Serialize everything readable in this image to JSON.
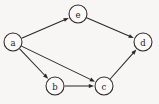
{
  "figure": {
    "kind": "directed-graph",
    "background_color": "#f7f6f4",
    "stroke_color": "#2a2724",
    "node_fill_color": "#fbfaf8",
    "node_radius": 9
  },
  "graph": {
    "directed": true,
    "nodes": [
      {
        "id": "a",
        "label": "a",
        "cx": 13,
        "cy": 42
      },
      {
        "id": "e",
        "label": "e",
        "cx": 78,
        "cy": 14
      },
      {
        "id": "d",
        "label": "d",
        "cx": 143,
        "cy": 42
      },
      {
        "id": "b",
        "label": "b",
        "cx": 55,
        "cy": 86
      },
      {
        "id": "c",
        "label": "c",
        "cx": 104,
        "cy": 86
      }
    ],
    "edges": [
      {
        "id": "a-e",
        "from": "a",
        "to": "e",
        "arrow_at": "e"
      },
      {
        "id": "e-d",
        "from": "e",
        "to": "d",
        "arrow_at": "d"
      },
      {
        "id": "a-b",
        "from": "a",
        "to": "b",
        "arrow_at": "b"
      },
      {
        "id": "a-c",
        "from": "a",
        "to": "c",
        "arrow_at": "c"
      },
      {
        "id": "b-c",
        "from": "b",
        "to": "c",
        "arrow_at": "c"
      },
      {
        "id": "c-d",
        "from": "c",
        "to": "d",
        "arrow_at": "d"
      }
    ]
  }
}
